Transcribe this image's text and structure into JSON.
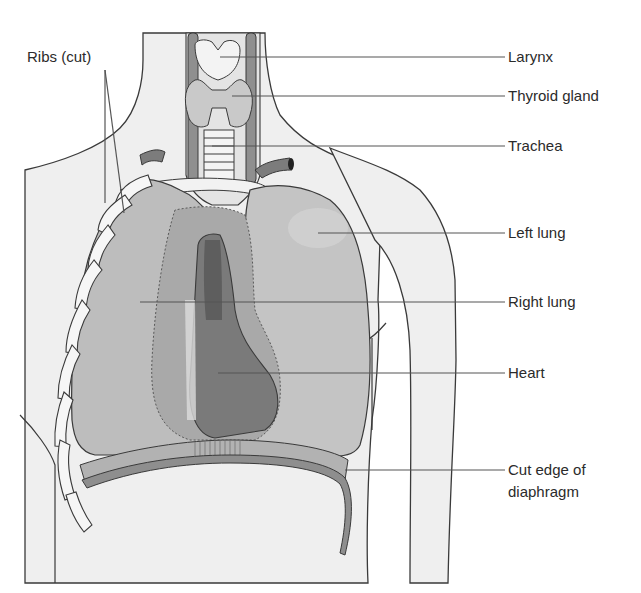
{
  "figure": {
    "labels": {
      "ribs": "Ribs (cut)",
      "larynx": "Larynx",
      "thyroid": "Thyroid gland",
      "trachea": "Trachea",
      "left_lung": "Left lung",
      "right_lung": "Right lung",
      "heart": "Heart",
      "diaphragm_line1": "Cut edge of",
      "diaphragm_line2": "diaphragm"
    },
    "colors": {
      "body_fill": "#efefef",
      "outline": "#3a3a3a",
      "lung_fill": "#bdbdbd",
      "lung_light": "#cfcfcf",
      "pericardium": "#a9a9a9",
      "heart_dark": "#6f6f6f",
      "heart_mid": "#8c8c8c",
      "rib_fill": "#f6f6f6",
      "diaphragm": "#9a9a9a",
      "vessel": "#7c7c7c",
      "leader_line": "#555555"
    }
  }
}
